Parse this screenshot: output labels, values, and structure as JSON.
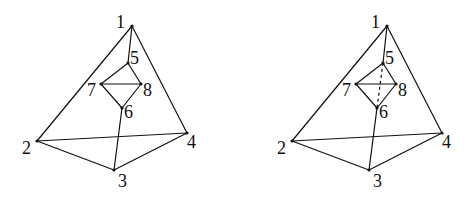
{
  "diagram": {
    "type": "graph-figures",
    "figures": [
      {
        "name": "figure-left",
        "offset_x": 0,
        "vertices": [
          {
            "id": "1",
            "x": 132,
            "y": 26,
            "lx": 116,
            "ly": 28
          },
          {
            "id": "2",
            "x": 37,
            "y": 141,
            "lx": 22,
            "ly": 154
          },
          {
            "id": "3",
            "x": 114,
            "y": 170,
            "lx": 118,
            "ly": 187
          },
          {
            "id": "4",
            "x": 187,
            "y": 133,
            "lx": 187,
            "ly": 148
          },
          {
            "id": "5",
            "x": 128,
            "y": 63,
            "lx": 130,
            "ly": 64
          },
          {
            "id": "6",
            "x": 122,
            "y": 108,
            "lx": 124,
            "ly": 118
          },
          {
            "id": "7",
            "x": 101,
            "y": 84,
            "lx": 87,
            "ly": 96
          },
          {
            "id": "8",
            "x": 141,
            "y": 84,
            "lx": 143,
            "ly": 96
          }
        ],
        "edges": [
          {
            "from": "1",
            "to": "2",
            "style": "solid"
          },
          {
            "from": "1",
            "to": "4",
            "style": "solid"
          },
          {
            "from": "1",
            "to": "5",
            "style": "solid"
          },
          {
            "from": "2",
            "to": "4",
            "style": "solid"
          },
          {
            "from": "2",
            "to": "3",
            "style": "solid"
          },
          {
            "from": "3",
            "to": "4",
            "style": "solid"
          },
          {
            "from": "3",
            "to": "6",
            "style": "solid"
          },
          {
            "from": "5",
            "to": "7",
            "style": "solid"
          },
          {
            "from": "5",
            "to": "8",
            "style": "solid"
          },
          {
            "from": "7",
            "to": "8",
            "style": "solid"
          },
          {
            "from": "7",
            "to": "6",
            "style": "solid"
          },
          {
            "from": "8",
            "to": "6",
            "style": "solid"
          }
        ]
      },
      {
        "name": "figure-right",
        "offset_x": 255,
        "vertices": [
          {
            "id": "1",
            "x": 132,
            "y": 26,
            "lx": 116,
            "ly": 28
          },
          {
            "id": "2",
            "x": 37,
            "y": 141,
            "lx": 22,
            "ly": 154
          },
          {
            "id": "3",
            "x": 114,
            "y": 170,
            "lx": 118,
            "ly": 187
          },
          {
            "id": "4",
            "x": 187,
            "y": 133,
            "lx": 187,
            "ly": 148
          },
          {
            "id": "5",
            "x": 128,
            "y": 63,
            "lx": 130,
            "ly": 64
          },
          {
            "id": "6",
            "x": 122,
            "y": 108,
            "lx": 124,
            "ly": 118
          },
          {
            "id": "7",
            "x": 101,
            "y": 84,
            "lx": 87,
            "ly": 96
          },
          {
            "id": "8",
            "x": 141,
            "y": 84,
            "lx": 143,
            "ly": 96
          }
        ],
        "edges": [
          {
            "from": "1",
            "to": "2",
            "style": "solid"
          },
          {
            "from": "1",
            "to": "4",
            "style": "solid"
          },
          {
            "from": "1",
            "to": "5",
            "style": "solid"
          },
          {
            "from": "2",
            "to": "4",
            "style": "solid"
          },
          {
            "from": "2",
            "to": "3",
            "style": "solid"
          },
          {
            "from": "3",
            "to": "4",
            "style": "solid"
          },
          {
            "from": "3",
            "to": "6",
            "style": "solid"
          },
          {
            "from": "5",
            "to": "7",
            "style": "solid"
          },
          {
            "from": "5",
            "to": "8",
            "style": "solid"
          },
          {
            "from": "7",
            "to": "8",
            "style": "solid"
          },
          {
            "from": "7",
            "to": "6",
            "style": "solid"
          },
          {
            "from": "8",
            "to": "6",
            "style": "solid"
          },
          {
            "from": "5",
            "to": "6",
            "style": "dashed"
          }
        ]
      }
    ]
  }
}
